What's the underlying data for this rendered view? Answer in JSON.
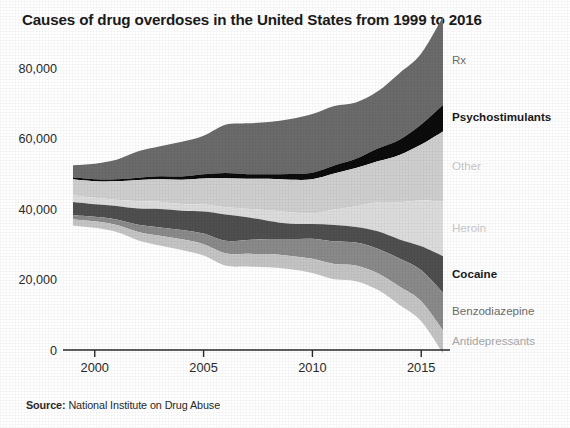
{
  "figure": {
    "title": "Causes of drug overdoses in the United States from 1999 to 2016",
    "source_prefix": "Source:",
    "source_text": "National Institute on Drug Abuse"
  },
  "chart_data": {
    "type": "area",
    "subtype": "streamgraph",
    "title": "Causes of drug overdoses in the United States from 1999 to 2016",
    "xlabel": "",
    "ylabel": "",
    "xlim": [
      1998.4,
      2016.6
    ],
    "ylim": [
      0,
      84000
    ],
    "grid": false,
    "legend_position": "right-inline-labels",
    "stack_order_top_to_bottom": [
      "Rx",
      "Psychostimulants",
      "Other",
      "Heroin",
      "Cocaine",
      "Benzodiazepine",
      "Antidepressants"
    ],
    "xticks": [
      2000,
      2005,
      2010,
      2015
    ],
    "xtick_labels": [
      "2000",
      "2005",
      "2010",
      "2015"
    ],
    "yticks": [
      0,
      20000,
      40000,
      60000,
      80000
    ],
    "ytick_labels": [
      "0",
      "20,000",
      "40,000",
      "60,000",
      "80,000"
    ],
    "x": [
      1999,
      2000,
      2001,
      2002,
      2003,
      2004,
      2005,
      2006,
      2007,
      2008,
      2009,
      2010,
      2011,
      2012,
      2013,
      2014,
      2015,
      2016
    ],
    "series": [
      {
        "name": "Rx",
        "color": "#6b6b6b",
        "label_style": "mid",
        "values": [
          3442,
          4400,
          5528,
          7456,
          8517,
          9857,
          10928,
          13723,
          14408,
          14800,
          15597,
          16651,
          16917,
          16007,
          16235,
          18893,
          20101,
          25052
        ]
      },
      {
        "name": "Psychostimulants",
        "color": "#0c0c0c",
        "label_style": "strong",
        "values": [
          547,
          573,
          583,
          671,
          806,
          926,
          1176,
          1468,
          1304,
          1304,
          1632,
          1854,
          2266,
          2635,
          3627,
          4298,
          5716,
          7542
        ]
      },
      {
        "name": "Other",
        "color": "#cfcfcf",
        "label_style": "faint",
        "values": [
          4500,
          4700,
          5200,
          6000,
          6400,
          6900,
          7400,
          8200,
          8500,
          8900,
          9200,
          9700,
          10200,
          10800,
          11600,
          13400,
          15900,
          19900
        ]
      },
      {
        "name": "Heroin",
        "color": "#dcdcdc",
        "label_style": "faint",
        "values": [
          1960,
          1842,
          1779,
          2089,
          2080,
          1878,
          2009,
          2088,
          2399,
          3041,
          3278,
          3036,
          4397,
          5925,
          8257,
          10574,
          12989,
          15469
        ]
      },
      {
        "name": "Cocaine",
        "color": "#4f4f4f",
        "label_style": "strong",
        "values": [
          3822,
          3544,
          3833,
          4599,
          5196,
          5443,
          6208,
          7448,
          6512,
          5129,
          4350,
          4183,
          4681,
          4404,
          4944,
          5415,
          6784,
          10375
        ]
      },
      {
        "name": "Benzodiazepine",
        "color": "#8a8a8a",
        "label_style": "mid",
        "values": [
          1135,
          1298,
          1591,
          2022,
          2370,
          2663,
          3034,
          3532,
          3903,
          4291,
          4773,
          5652,
          6386,
          6524,
          6973,
          7945,
          8791,
          10684
        ]
      },
      {
        "name": "Antidepressants",
        "color": "#c4c4c4",
        "label_style": "soft",
        "values": [
          1749,
          1855,
          2004,
          2418,
          2760,
          3011,
          3218,
          3504,
          3603,
          3726,
          3799,
          4029,
          4331,
          4416,
          4683,
          5225,
          5662,
          6513
        ]
      }
    ],
    "annotations": [
      {
        "text": "Rx",
        "series": "Rx"
      },
      {
        "text": "Psychostimulants",
        "series": "Psychostimulants"
      },
      {
        "text": "Other",
        "series": "Other"
      },
      {
        "text": "Heroin",
        "series": "Heroin"
      },
      {
        "text": "Cocaine",
        "series": "Cocaine"
      },
      {
        "text": "Benzodiazepine",
        "series": "Benzodiazepine"
      },
      {
        "text": "Antidepressants",
        "series": "Antidepressants"
      }
    ]
  }
}
